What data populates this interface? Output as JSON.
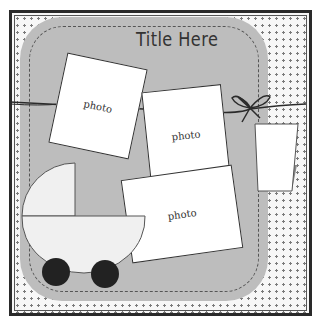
{
  "layout": {
    "title": "Title Here",
    "photos": [
      {
        "label": "photo"
      },
      {
        "label": "photo"
      },
      {
        "label": "photo"
      }
    ],
    "embellishments": [
      "twine-with-bow",
      "tag",
      "baby-carriage"
    ]
  },
  "colors": {
    "panel": "#bdbdbd",
    "border": "#2a2a2a",
    "dots": "#7a7a7a",
    "wheels": "#222222",
    "carriage": "#f0f0f0",
    "tag_triangle": "#888888"
  }
}
